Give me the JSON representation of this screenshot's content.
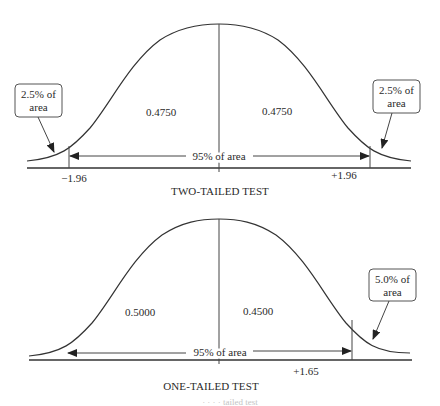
{
  "diagrams": [
    {
      "id": "two-tailed",
      "title": "TWO-TAILED TEST",
      "regions": {
        "left_center_area": "0.4750",
        "right_center_area": "0.4750"
      },
      "span_label": "95% of area",
      "cutoffs": {
        "left": "−1.96",
        "right": "+1.96"
      },
      "callouts": [
        {
          "line1": "2.5% of",
          "line2": "area",
          "side": "left"
        },
        {
          "line1": "2.5% of",
          "line2": "area",
          "side": "right"
        }
      ]
    },
    {
      "id": "one-tailed",
      "title": "ONE-TAILED TEST",
      "regions": {
        "left_center_area": "0.5000",
        "right_center_area": "0.4500"
      },
      "span_label": "95% of area",
      "cutoffs": {
        "right": "+1.65"
      },
      "callouts": [
        {
          "line1": "5.0% of",
          "line2": "area",
          "side": "right"
        }
      ]
    }
  ],
  "footer_fragment": "·   ·   ·   ·   tailed test"
}
